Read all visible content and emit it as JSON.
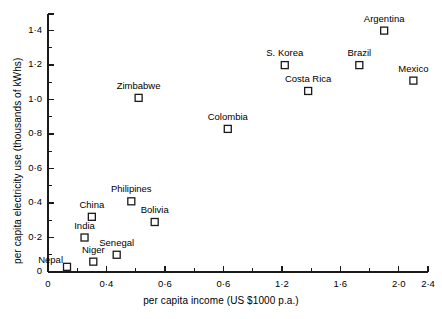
{
  "chart_data": {
    "type": "scatter",
    "title": "",
    "xlabel": "per capita income (US $1000 p.a.)",
    "ylabel": "per capita electricity use (thousands of kWhs)",
    "xlim": [
      0,
      2.6
    ],
    "ylim": [
      0,
      1.45
    ],
    "grid": false,
    "legend": "none",
    "marker": "open-square",
    "x_major_ticks": [
      0,
      0.4,
      0.8,
      1.2,
      1.6,
      2.0,
      2.4,
      2.6
    ],
    "x_tick_labels": [
      "0",
      "0·4",
      "0·6",
      "0·6",
      "1·2",
      "1·6",
      "2·0",
      "2·4",
      "2·6"
    ],
    "x_minor_step": 0.2,
    "y_major_ticks": [
      0,
      0.2,
      0.4,
      0.6,
      0.8,
      1.0,
      1.2,
      1.4
    ],
    "y_tick_labels": [
      "0",
      "0·2",
      "0·4",
      "0·6",
      "0·8",
      "1·0",
      "1·2",
      "1·4"
    ],
    "y_minor_step": 0.1,
    "points": [
      {
        "label": "Nepal",
        "x": 0.13,
        "y": 0.03,
        "label_pos": "left"
      },
      {
        "label": "Niger",
        "x": 0.31,
        "y": 0.06,
        "label_pos": "above"
      },
      {
        "label": "India",
        "x": 0.25,
        "y": 0.2,
        "label_pos": "above"
      },
      {
        "label": "China",
        "x": 0.3,
        "y": 0.32,
        "label_pos": "above"
      },
      {
        "label": "Senegal",
        "x": 0.47,
        "y": 0.1,
        "label_pos": "above"
      },
      {
        "label": "Philipines",
        "x": 0.57,
        "y": 0.41,
        "label_pos": "above"
      },
      {
        "label": "Bolivia",
        "x": 0.73,
        "y": 0.29,
        "label_pos": "above"
      },
      {
        "label": "Colombia",
        "x": 1.23,
        "y": 0.83,
        "label_pos": "above"
      },
      {
        "label": "Zimbabwe",
        "x": 0.62,
        "y": 1.01,
        "label_pos": "above"
      },
      {
        "label": "S. Korea",
        "x": 1.62,
        "y": 1.2,
        "label_pos": "above"
      },
      {
        "label": "Costa Rica",
        "x": 1.78,
        "y": 1.05,
        "label_pos": "above"
      },
      {
        "label": "Brazil",
        "x": 2.13,
        "y": 1.2,
        "label_pos": "above"
      },
      {
        "label": "Argentina",
        "x": 2.3,
        "y": 1.4,
        "label_pos": "above"
      },
      {
        "label": "Mexico",
        "x": 2.5,
        "y": 1.11,
        "label_pos": "above"
      }
    ]
  },
  "axis": {
    "x_title": "per capita income (US $1000 p.a.)",
    "y_title": "per capita electricity use (thousands of kWhs)"
  },
  "colors": {
    "axis": "#1a1a1a",
    "marker": "#1a1a1a",
    "text": "#000000",
    "background": "#ffffff"
  }
}
